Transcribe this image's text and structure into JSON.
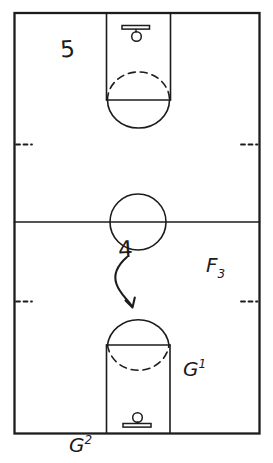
{
  "labels": {
    "player5": "5",
    "player4": "4",
    "forward3": {
      "letter": "F",
      "sub": "3"
    },
    "guard1": {
      "letter": "G",
      "sup": "1"
    },
    "guard2": {
      "letter": "G",
      "sup": "2"
    }
  },
  "colors": {
    "ink": "#1c1c1c",
    "background": "#ffffff"
  }
}
